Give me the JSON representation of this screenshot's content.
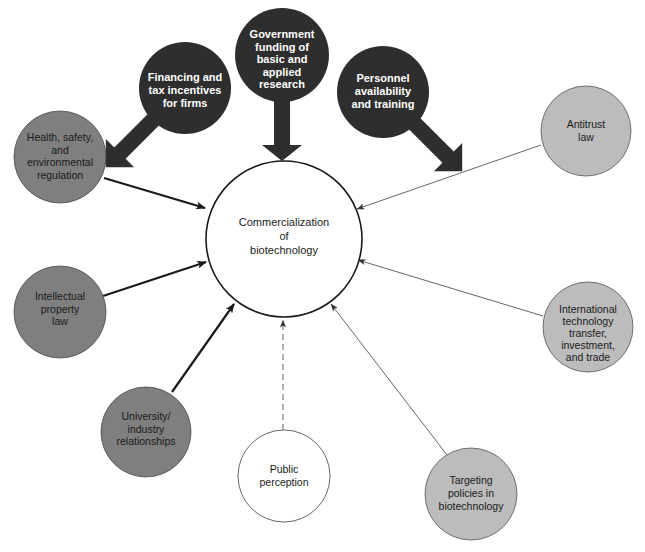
{
  "diagram": {
    "type": "influence-diagram",
    "center": {
      "lines": [
        "Commercialization",
        "of",
        "biotechnology"
      ]
    },
    "colors": {
      "dark": "#2e2e2e",
      "medium": "#7f7f7f",
      "light": "#bcbcbc",
      "white": "#ffffff",
      "stroke": "#1a1a1a"
    },
    "strong_influences": [
      {
        "id": "financing",
        "lines": [
          "Financing and",
          "tax incentives",
          "for firms"
        ]
      },
      {
        "id": "government",
        "lines": [
          "Government",
          "funding of",
          "basic and",
          "applied",
          "research"
        ]
      },
      {
        "id": "personnel",
        "lines": [
          "Personnel",
          "availability",
          "and training"
        ]
      }
    ],
    "medium_influences": [
      {
        "id": "health",
        "lines": [
          "Health, safety,",
          "and",
          "environmental",
          "regulation"
        ]
      },
      {
        "id": "ip",
        "lines": [
          "Intellectual",
          "property",
          "law"
        ]
      },
      {
        "id": "university",
        "lines": [
          "University/",
          "industry",
          "relationships"
        ]
      }
    ],
    "weak_influences": [
      {
        "id": "antitrust",
        "lines": [
          "Antitrust",
          "law"
        ]
      },
      {
        "id": "international",
        "lines": [
          "International",
          "technology",
          "transfer,",
          "investment,",
          "and trade"
        ]
      },
      {
        "id": "targeting",
        "lines": [
          "Targeting",
          "policies in",
          "biotechnology"
        ]
      }
    ],
    "uncertain_influences": [
      {
        "id": "public",
        "lines": [
          "Public",
          "perception"
        ]
      }
    ]
  }
}
